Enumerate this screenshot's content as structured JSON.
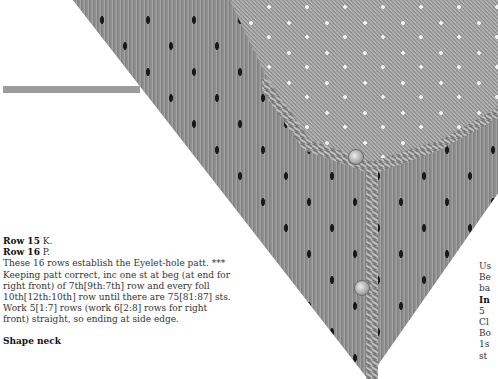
{
  "photo": {
    "subject": "knitted-cardigan-front-detail",
    "buttons": [
      {
        "x": 355,
        "y": 156
      },
      {
        "x": 361,
        "y": 287
      }
    ]
  },
  "left_column": {
    "row15_label": "Row 15",
    "row15_text": " K.",
    "row16_label": "Row 16",
    "row16_text": " P.",
    "paragraph": "These 16 rows establish the Eyelet-hole patt. *** Keeping patt correct, inc one st at beg (at end for right front) of 7th[9th:7th] row and every foll 10th[12th:10th] row until there are 75[81:87] sts. Work 5[1:7] rows (work 6[2:8] rows for right front) straight, so ending at side edge.",
    "next_heading": "Shape neck"
  },
  "right_column": {
    "lines": [
      "Us",
      "Be",
      "ba"
    ],
    "bold_line": "In",
    "lines_after": [
      "5",
      "Cl",
      "Bo",
      "1s",
      "st"
    ]
  }
}
